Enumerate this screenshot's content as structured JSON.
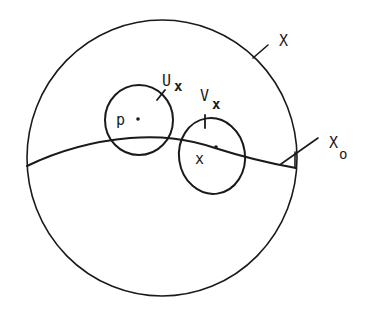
{
  "diagram": {
    "type": "topology-neighborhood-sketch",
    "colors": {
      "ink": "#1a1a1a",
      "background": "#ffffff"
    },
    "space": {
      "label": "X"
    },
    "subspace": {
      "label_main": "X",
      "label_sub": "o"
    },
    "neighborhood_u": {
      "label_main": "U",
      "label_sub": "x"
    },
    "neighborhood_v": {
      "label_main": "V",
      "label_sub": "x"
    },
    "point_p": {
      "label": "p"
    },
    "point_x": {
      "label": "x"
    }
  }
}
